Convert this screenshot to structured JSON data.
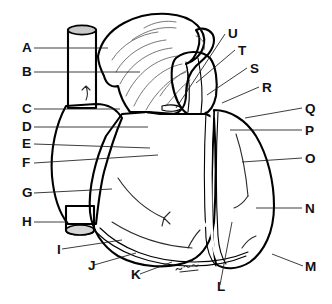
{
  "figure": {
    "caption": "",
    "background_color": "#ffffff",
    "width": 332,
    "height": 304,
    "artist_mark": "signature scribble at cardiac apex"
  },
  "palette": {
    "outline": "#000000",
    "leader_line": "#1a1a1a",
    "label_text": "#111111",
    "auricle_white": "#fdfdfd",
    "vena_cava_gray": "#9a9a9a",
    "right_atrium_gray": "#9c9c9c",
    "right_ventricle_gray": "#8d8d8d",
    "left_ventricle_gray": "#6d6d6d",
    "pulmonary_trunk_gray": "#8f8f8f",
    "coronary_vessel_white": "#ffffff"
  },
  "labels": [
    {
      "id": "A",
      "text": "A",
      "side": "left",
      "x": 22,
      "y": 52,
      "leader": "M34,48 L108,48"
    },
    {
      "id": "B",
      "text": "B",
      "side": "left",
      "x": 22,
      "y": 76,
      "leader": "M34,72 L140,72"
    },
    {
      "id": "C",
      "text": "C",
      "side": "left",
      "x": 22,
      "y": 113,
      "leader": "M34,109 L120,109"
    },
    {
      "id": "D",
      "text": "D",
      "side": "left",
      "x": 22,
      "y": 131,
      "leader": "M34,127 L148,127"
    },
    {
      "id": "E",
      "text": "E",
      "side": "left",
      "x": 22,
      "y": 148,
      "leader": "M34,144 L150,148"
    },
    {
      "id": "F",
      "text": "F",
      "side": "left",
      "x": 22,
      "y": 167,
      "leader": "M34,163 L158,155"
    },
    {
      "id": "G",
      "text": "G",
      "side": "left",
      "x": 22,
      "y": 197,
      "leader": "M34,193 L112,189"
    },
    {
      "id": "H",
      "text": "H",
      "side": "left",
      "x": 22,
      "y": 226,
      "leader": "M34,222 L68,222"
    },
    {
      "id": "I",
      "text": "I",
      "side": "bottom",
      "x": 57,
      "y": 254,
      "leader": "M62,249 L122,240"
    },
    {
      "id": "J",
      "text": "J",
      "side": "bottom",
      "x": 88,
      "y": 270,
      "leader": "M94,265 L136,253"
    },
    {
      "id": "K",
      "text": "K",
      "side": "bottom",
      "x": 131,
      "y": 279,
      "leader": "M140,274 L172,262"
    },
    {
      "id": "L",
      "text": "L",
      "side": "bottom",
      "x": 217,
      "y": 291,
      "leader": "M220,285 L232,222"
    },
    {
      "id": "M",
      "text": "M",
      "side": "right",
      "x": 305,
      "y": 271,
      "leader": "M303,266 L272,254"
    },
    {
      "id": "N",
      "text": "N",
      "side": "right",
      "x": 305,
      "y": 213,
      "leader": "M302,208 L256,208"
    },
    {
      "id": "O",
      "text": "O",
      "side": "right",
      "x": 305,
      "y": 163,
      "leader": "M302,158 L242,162"
    },
    {
      "id": "P",
      "text": "P",
      "side": "right",
      "x": 305,
      "y": 135,
      "leader": "M302,130 L230,130"
    },
    {
      "id": "Q",
      "text": "Q",
      "side": "right",
      "x": 305,
      "y": 113,
      "leader": "M302,108 L245,118"
    },
    {
      "id": "R",
      "text": "R",
      "side": "right",
      "x": 262,
      "y": 92,
      "leader": "M259,87 L222,103"
    },
    {
      "id": "S",
      "text": "S",
      "side": "right",
      "x": 250,
      "y": 73,
      "leader": "M247,68 L207,95"
    },
    {
      "id": "T",
      "text": "T",
      "side": "right",
      "x": 238,
      "y": 55,
      "leader": "M235,50 L196,83"
    },
    {
      "id": "U",
      "text": "U",
      "side": "right",
      "x": 228,
      "y": 38,
      "leader": "M225,34 L176,108"
    }
  ],
  "structures": [
    {
      "name": "superior-vena-cava",
      "fill": "#9a9a9a",
      "texture": "flat"
    },
    {
      "name": "right-atrium",
      "fill": "#9c9c9c",
      "texture": "flat"
    },
    {
      "name": "inferior-vena-cava",
      "fill": "#9a9a9a",
      "texture": "flat"
    },
    {
      "name": "right-auricle-appendage",
      "fill": "#fdfdfd",
      "texture": "striated"
    },
    {
      "name": "aortic-arch",
      "fill": "#fdfdfd",
      "texture": "striated"
    },
    {
      "name": "pulmonary-trunk",
      "fill": "#8f8f8f",
      "texture": "stipple"
    },
    {
      "name": "right-ventricle",
      "fill": "#8d8d8d",
      "texture": "stipple"
    },
    {
      "name": "left-ventricle",
      "fill": "#6d6d6d",
      "texture": "stipple-dark"
    },
    {
      "name": "anterior-interventricular-artery",
      "fill": "none",
      "texture": "white-line"
    },
    {
      "name": "cardiac-apex",
      "fill": "#6d6d6d",
      "texture": "stipple-dark"
    }
  ]
}
